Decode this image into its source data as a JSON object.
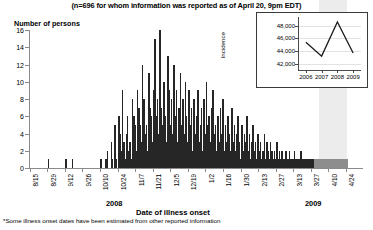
{
  "subtitle": "(n=696 for whom information was reported as of April 20, 9pm EDT)",
  "axis": {
    "y_label": "Number of persons",
    "x_label": "Date of illness onset",
    "year_left": "2008",
    "year_right": "2009"
  },
  "footnote": "*Some illness onset dates have been estimated from other reported information",
  "inset": {
    "y_label": "Incidence"
  },
  "chart_data": {
    "type": "bar",
    "title": "",
    "subtitle": "(n=696 for whom information was reported as of April 20, 9pm EDT)",
    "xlabel": "Date of illness onset",
    "ylabel": "Number of persons",
    "ylim": [
      0,
      16
    ],
    "ytick_labels": [
      "0",
      "2",
      "4",
      "6",
      "8",
      "10",
      "12",
      "14",
      "16"
    ],
    "ytick_values": [
      0,
      2,
      4,
      6,
      8,
      10,
      12,
      14,
      16
    ],
    "grid": false,
    "legend": "none",
    "xtick_labels": [
      "8/15",
      "8/29",
      "9/12",
      "9/26",
      "10/10",
      "10/24",
      "11/7",
      "11/21",
      "12/5",
      "12/19",
      "1/2",
      "1/16",
      "1/30",
      "2/13",
      "2/27",
      "3/13",
      "3/27",
      "4/10",
      "4/24"
    ],
    "xtick_indices": [
      0,
      14,
      28,
      42,
      56,
      70,
      84,
      98,
      112,
      126,
      140,
      154,
      168,
      182,
      196,
      210,
      224,
      238,
      252
    ],
    "shaded_region": {
      "label": "reporting-delay",
      "start_index": 231,
      "end_index": 253,
      "color": "#ececec"
    },
    "bar_color": "#262626",
    "faded_bar_color": "#8d8d8d",
    "faded_start_index": 226,
    "values": [
      0,
      0,
      0,
      0,
      0,
      0,
      0,
      0,
      0,
      0,
      0,
      0,
      0,
      0,
      1,
      0,
      0,
      0,
      0,
      0,
      0,
      0,
      0,
      0,
      0,
      0,
      0,
      0,
      1,
      0,
      0,
      0,
      0,
      1,
      0,
      0,
      0,
      0,
      0,
      0,
      0,
      0,
      0,
      0,
      0,
      0,
      0,
      0,
      0,
      0,
      0,
      0,
      0,
      0,
      0,
      0,
      1,
      0,
      0,
      0,
      1,
      2,
      0,
      0,
      3,
      1,
      0,
      5,
      1,
      0,
      6,
      4,
      2,
      9,
      3,
      1,
      4,
      6,
      2,
      3,
      1,
      8,
      6,
      5,
      2,
      9,
      7,
      5,
      3,
      12,
      8,
      4,
      5,
      2,
      11,
      7,
      6,
      3,
      9,
      15,
      6,
      8,
      4,
      16,
      7,
      5,
      10,
      6,
      3,
      13,
      9,
      5,
      8,
      4,
      12,
      6,
      9,
      3,
      7,
      11,
      5,
      8,
      4,
      10,
      6,
      3,
      9,
      5,
      7,
      2,
      8,
      4,
      6,
      9,
      3,
      5,
      7,
      2,
      8,
      4,
      10,
      5,
      6,
      3,
      7,
      9,
      4,
      5,
      2,
      6,
      3,
      7,
      4,
      8,
      2,
      5,
      3,
      6,
      4,
      2,
      7,
      3,
      5,
      2,
      4,
      6,
      3,
      1,
      5,
      2,
      4,
      3,
      6,
      2,
      4,
      1,
      3,
      5,
      2,
      3,
      1,
      4,
      2,
      3,
      1,
      2,
      4,
      1,
      3,
      2,
      1,
      3,
      2,
      1,
      2,
      1,
      3,
      1,
      2,
      1,
      2,
      1,
      1,
      2,
      1,
      1,
      2,
      1,
      1,
      1,
      2,
      1,
      1,
      1,
      1,
      2,
      1,
      1,
      1,
      1,
      1,
      1,
      1,
      1,
      1,
      1,
      1,
      1,
      1,
      1,
      1,
      1,
      1,
      1,
      1,
      1,
      1,
      1,
      1,
      1,
      1,
      1,
      1,
      1,
      1,
      1,
      1,
      1,
      1,
      1,
      1,
      1,
      1,
      0,
      0,
      0,
      0,
      0,
      0,
      0,
      0,
      0,
      0,
      0,
      0,
      0
    ]
  },
  "inset_chart_data": {
    "type": "line",
    "title": "",
    "xlabel": "",
    "ylabel": "Incidence",
    "x": [
      "2006",
      "2007",
      "2008",
      "2009"
    ],
    "values": [
      45400,
      43200,
      48600,
      43700
    ],
    "ylim": [
      41000,
      49400
    ],
    "ytick_labels": [
      "42,000",
      "44,000",
      "46,000",
      "48,000"
    ],
    "ytick_values": [
      42000,
      44000,
      46000,
      48000
    ],
    "grid": true,
    "line_color": "#1a1a1a"
  }
}
